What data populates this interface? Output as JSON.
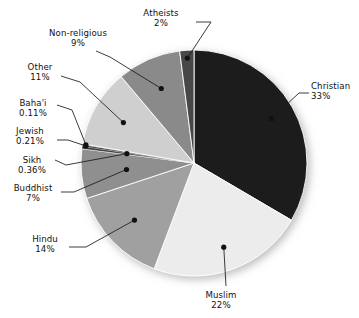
{
  "chart_data": {
    "type": "pie",
    "title": "",
    "subtitle": "",
    "xlabel": "",
    "ylabel": "",
    "legend_position": "none",
    "grid": false,
    "label_format": "name + percent",
    "start_angle_deg": 0,
    "direction": "clockwise",
    "categories": [
      "Christian",
      "Muslim",
      "Hindu",
      "Buddhist",
      "Sikh",
      "Jewish",
      "Baha'i",
      "Other",
      "Non-religious",
      "Atheists"
    ],
    "values": [
      33,
      22,
      14,
      7,
      0.36,
      0.21,
      0.11,
      11,
      9,
      2
    ],
    "value_labels": [
      "33%",
      "22%",
      "14%",
      "7%",
      "0.36%",
      "0.21%",
      "0.11%",
      "11%",
      "9%",
      "2%"
    ],
    "colors": [
      "#1f1f1f",
      "#ececec",
      "#a0a0a0",
      "#8f8f8f",
      "#3a3a3a",
      "#101010",
      "#555555",
      "#cfcfcf",
      "#8a8a8a",
      "#464646"
    ],
    "slices": [
      {
        "name": "Christian",
        "percent_label": "33%",
        "value": 33,
        "color": "#1f1f1f"
      },
      {
        "name": "Muslim",
        "percent_label": "22%",
        "value": 22,
        "color": "#ececec"
      },
      {
        "name": "Hindu",
        "percent_label": "14%",
        "value": 14,
        "color": "#a0a0a0"
      },
      {
        "name": "Buddhist",
        "percent_label": "7%",
        "value": 7,
        "color": "#8f8f8f"
      },
      {
        "name": "Sikh",
        "percent_label": "0.36%",
        "value": 0.36,
        "color": "#3a3a3a"
      },
      {
        "name": "Jewish",
        "percent_label": "0.21%",
        "value": 0.21,
        "color": "#101010"
      },
      {
        "name": "Baha'i",
        "percent_label": "0.11%",
        "value": 0.11,
        "color": "#555555"
      },
      {
        "name": "Other",
        "percent_label": "11%",
        "value": 11,
        "color": "#cfcfcf"
      },
      {
        "name": "Non-religious",
        "percent_label": "9%",
        "value": 9,
        "color": "#8a8a8a"
      },
      {
        "name": "Atheists",
        "percent_label": "2%",
        "value": 2,
        "color": "#464646"
      }
    ]
  },
  "labels": {
    "christian": {
      "name": "Christian",
      "pct": "33%"
    },
    "muslim": {
      "name": "Muslim",
      "pct": "22%"
    },
    "hindu": {
      "name": "Hindu",
      "pct": "14%"
    },
    "buddhist": {
      "name": "Buddhist",
      "pct": "7%"
    },
    "sikh": {
      "name": "Sikh",
      "pct": "0.36%"
    },
    "jewish": {
      "name": "Jewish",
      "pct": "0.21%"
    },
    "bahai": {
      "name": "Baha'i",
      "pct": "0.11%"
    },
    "other": {
      "name": "Other",
      "pct": "11%"
    },
    "nonreligious": {
      "name": "Non-religious",
      "pct": "9%"
    },
    "atheists": {
      "name": "Atheists",
      "pct": "2%"
    }
  },
  "style": {
    "background": "#ffffff",
    "text_color": "#111111",
    "leader_line_color": "#1a1a1a",
    "slice_edge_color": "#ffffff"
  }
}
